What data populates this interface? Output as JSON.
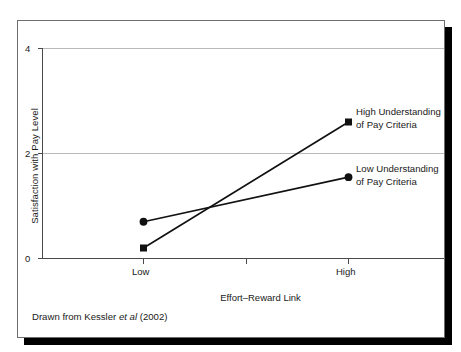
{
  "figure": {
    "caption_prefix": "Drawn from Kessler ",
    "caption_italic": "et al",
    "caption_suffix": " (2002)",
    "frame_color": "#6d6d6d",
    "shadow_color": "#000000",
    "line_color": "#111111",
    "grid_color": "#b9b9b9"
  },
  "chart_data": {
    "type": "line",
    "title": "",
    "xlabel": "Effort–Reward Link",
    "ylabel": "Satisfaction with Pay Level",
    "categories": [
      "Low",
      "High"
    ],
    "x_tick_labels": [
      "Low",
      "High"
    ],
    "y_tick_labels": [
      "0",
      "2",
      "4"
    ],
    "y_ticks": [
      0,
      2,
      4
    ],
    "ylim": [
      0,
      4
    ],
    "grid": "horizontal",
    "legend": "inline-right-of-endpoints",
    "series": [
      {
        "name": "High Understanding of Pay Criteria",
        "label_line1": "High Understanding",
        "label_line2": "of Pay Criteria",
        "marker": "square",
        "values": [
          0.2,
          2.6
        ]
      },
      {
        "name": "Low Understanding of Pay Criteria",
        "label_line1": "Low Understanding",
        "label_line2": "of Pay Criteria",
        "marker": "circle",
        "values": [
          0.7,
          1.55
        ]
      }
    ]
  }
}
